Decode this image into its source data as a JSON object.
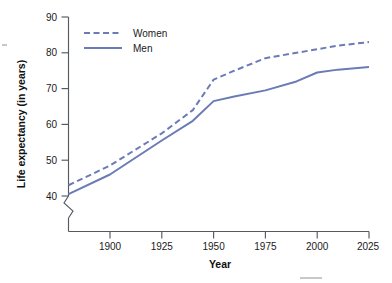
{
  "chart_data": {
    "type": "line",
    "title": "",
    "xlabel": "Year",
    "ylabel": "Life expectancy (in years)",
    "xlim": [
      1880,
      2025
    ],
    "ylim": [
      40,
      90
    ],
    "y_axis_break": true,
    "grid": false,
    "legend_position": "top-left",
    "x_ticks": [
      1900,
      1925,
      1950,
      1975,
      2000,
      2025
    ],
    "y_ticks": [
      40,
      50,
      60,
      70,
      80,
      90
    ],
    "series": [
      {
        "name": "Women",
        "style": "dashed",
        "color": "#6b7bb5",
        "x": [
          1880,
          1900,
          1925,
          1940,
          1950,
          1960,
          1975,
          1990,
          2000,
          2010,
          2025
        ],
        "values": [
          43,
          48.5,
          57.5,
          64,
          72.5,
          75,
          78.5,
          80,
          81,
          82,
          83
        ]
      },
      {
        "name": "Men",
        "style": "solid",
        "color": "#6b7bb5",
        "x": [
          1880,
          1900,
          1925,
          1940,
          1950,
          1960,
          1975,
          1990,
          2000,
          2010,
          2025
        ],
        "values": [
          40.5,
          46,
          55.5,
          61,
          66.5,
          67.8,
          69.5,
          72,
          74.5,
          75.3,
          76
        ]
      }
    ]
  },
  "axis": {
    "y_tick_labels": [
      "40",
      "50",
      "60",
      "70",
      "80",
      "90"
    ],
    "x_tick_labels": [
      "1900",
      "1925",
      "1950",
      "1975",
      "2000",
      "2025"
    ],
    "x_title": "Year",
    "y_title": "Life expectancy (in years)"
  },
  "legend": {
    "items": [
      {
        "label": "Women",
        "style": "dashed"
      },
      {
        "label": "Men",
        "style": "solid"
      }
    ]
  },
  "colors": {
    "series": "#6b7bb5",
    "axis": "#555a60",
    "text": "#1a1a1a"
  }
}
